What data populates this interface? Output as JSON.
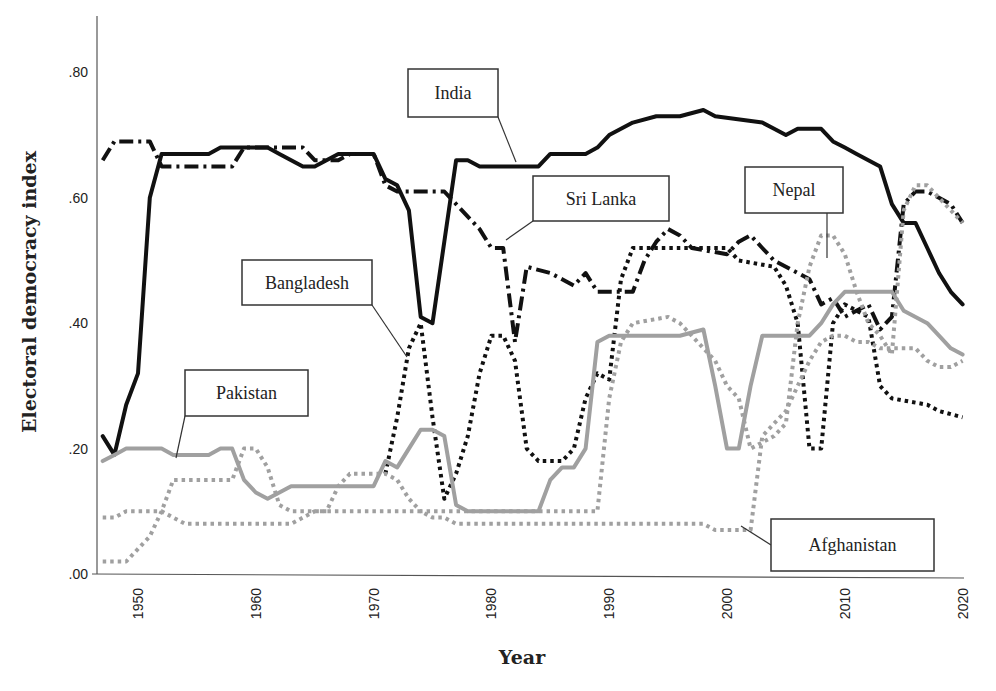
{
  "chart_data": {
    "type": "line",
    "title": "",
    "xlabel": "Year",
    "ylabel": "Electoral democracy index",
    "xlim": [
      1947,
      2020
    ],
    "ylim": [
      0,
      0.9
    ],
    "grid": false,
    "legend": "callout labels",
    "x_ticks": [
      "1950",
      "1960",
      "1970",
      "1980",
      "1990",
      "2000",
      "2010",
      "2020"
    ],
    "y_ticks": [
      ".00",
      ".20",
      ".40",
      ".60",
      ".80"
    ],
    "series": [
      {
        "name": "India",
        "style": "solid",
        "color": "#111111",
        "width": 4,
        "points": [
          [
            1947,
            0.22
          ],
          [
            1948,
            0.19
          ],
          [
            1949,
            0.27
          ],
          [
            1950,
            0.32
          ],
          [
            1951,
            0.6
          ],
          [
            1952,
            0.67
          ],
          [
            1956,
            0.67
          ],
          [
            1957,
            0.68
          ],
          [
            1961,
            0.68
          ],
          [
            1962,
            0.67
          ],
          [
            1964,
            0.65
          ],
          [
            1965,
            0.65
          ],
          [
            1967,
            0.67
          ],
          [
            1970,
            0.67
          ],
          [
            1971,
            0.63
          ],
          [
            1972,
            0.62
          ],
          [
            1973,
            0.58
          ],
          [
            1974,
            0.41
          ],
          [
            1975,
            0.4
          ],
          [
            1976,
            0.53
          ],
          [
            1977,
            0.66
          ],
          [
            1978,
            0.66
          ],
          [
            1979,
            0.65
          ],
          [
            1984,
            0.65
          ],
          [
            1985,
            0.67
          ],
          [
            1988,
            0.67
          ],
          [
            1989,
            0.68
          ],
          [
            1990,
            0.7
          ],
          [
            1992,
            0.72
          ],
          [
            1994,
            0.73
          ],
          [
            1996,
            0.73
          ],
          [
            1998,
            0.74
          ],
          [
            1999,
            0.73
          ],
          [
            2003,
            0.72
          ],
          [
            2004,
            0.71
          ],
          [
            2005,
            0.7
          ],
          [
            2006,
            0.71
          ],
          [
            2008,
            0.71
          ],
          [
            2009,
            0.69
          ],
          [
            2010,
            0.68
          ],
          [
            2011,
            0.67
          ],
          [
            2013,
            0.65
          ],
          [
            2014,
            0.59
          ],
          [
            2015,
            0.56
          ],
          [
            2016,
            0.56
          ],
          [
            2017,
            0.52
          ],
          [
            2018,
            0.48
          ],
          [
            2019,
            0.45
          ],
          [
            2020,
            0.43
          ]
        ]
      },
      {
        "name": "Sri Lanka",
        "style": "dashdot",
        "color": "#111111",
        "width": 4,
        "points": [
          [
            1947,
            0.66
          ],
          [
            1948,
            0.69
          ],
          [
            1951,
            0.69
          ],
          [
            1952,
            0.65
          ],
          [
            1958,
            0.65
          ],
          [
            1959,
            0.68
          ],
          [
            1964,
            0.68
          ],
          [
            1965,
            0.66
          ],
          [
            1967,
            0.66
          ],
          [
            1968,
            0.67
          ],
          [
            1970,
            0.67
          ],
          [
            1971,
            0.62
          ],
          [
            1972,
            0.61
          ],
          [
            1976,
            0.61
          ],
          [
            1977,
            0.59
          ],
          [
            1978,
            0.57
          ],
          [
            1979,
            0.55
          ],
          [
            1980,
            0.52
          ],
          [
            1981,
            0.52
          ],
          [
            1982,
            0.37
          ],
          [
            1983,
            0.49
          ],
          [
            1985,
            0.48
          ],
          [
            1986,
            0.47
          ],
          [
            1987,
            0.46
          ],
          [
            1988,
            0.48
          ],
          [
            1989,
            0.45
          ],
          [
            1992,
            0.45
          ],
          [
            1993,
            0.5
          ],
          [
            1994,
            0.53
          ],
          [
            1995,
            0.55
          ],
          [
            1996,
            0.54
          ],
          [
            1997,
            0.52
          ],
          [
            2000,
            0.51
          ],
          [
            2001,
            0.53
          ],
          [
            2002,
            0.54
          ],
          [
            2003,
            0.52
          ],
          [
            2004,
            0.5
          ],
          [
            2006,
            0.48
          ],
          [
            2007,
            0.47
          ],
          [
            2008,
            0.43
          ],
          [
            2009,
            0.44
          ],
          [
            2010,
            0.41
          ],
          [
            2012,
            0.43
          ],
          [
            2013,
            0.39
          ],
          [
            2014,
            0.41
          ],
          [
            2015,
            0.59
          ],
          [
            2016,
            0.61
          ],
          [
            2017,
            0.61
          ],
          [
            2018,
            0.6
          ],
          [
            2019,
            0.59
          ],
          [
            2020,
            0.56
          ]
        ]
      },
      {
        "name": "Bangladesh",
        "style": "dotted",
        "color": "#111111",
        "width": 4,
        "points": [
          [
            1971,
            0.16
          ],
          [
            1972,
            0.25
          ],
          [
            1973,
            0.36
          ],
          [
            1974,
            0.4
          ],
          [
            1975,
            0.25
          ],
          [
            1976,
            0.12
          ],
          [
            1977,
            0.16
          ],
          [
            1978,
            0.22
          ],
          [
            1979,
            0.32
          ],
          [
            1980,
            0.38
          ],
          [
            1981,
            0.38
          ],
          [
            1982,
            0.34
          ],
          [
            1983,
            0.2
          ],
          [
            1984,
            0.18
          ],
          [
            1986,
            0.18
          ],
          [
            1987,
            0.2
          ],
          [
            1988,
            0.28
          ],
          [
            1989,
            0.32
          ],
          [
            1990,
            0.31
          ],
          [
            1991,
            0.47
          ],
          [
            1992,
            0.52
          ],
          [
            2000,
            0.52
          ],
          [
            2001,
            0.5
          ],
          [
            2004,
            0.49
          ],
          [
            2005,
            0.46
          ],
          [
            2006,
            0.4
          ],
          [
            2007,
            0.2
          ],
          [
            2008,
            0.2
          ],
          [
            2009,
            0.4
          ],
          [
            2010,
            0.43
          ],
          [
            2011,
            0.42
          ],
          [
            2012,
            0.41
          ],
          [
            2013,
            0.3
          ],
          [
            2014,
            0.28
          ],
          [
            2017,
            0.27
          ],
          [
            2018,
            0.26
          ],
          [
            2020,
            0.25
          ]
        ]
      },
      {
        "name": "Pakistan",
        "style": "solid",
        "color": "#a0a0a0",
        "width": 4,
        "points": [
          [
            1947,
            0.18
          ],
          [
            1948,
            0.19
          ],
          [
            1949,
            0.2
          ],
          [
            1952,
            0.2
          ],
          [
            1953,
            0.19
          ],
          [
            1956,
            0.19
          ],
          [
            1957,
            0.2
          ],
          [
            1958,
            0.2
          ],
          [
            1959,
            0.15
          ],
          [
            1960,
            0.13
          ],
          [
            1961,
            0.12
          ],
          [
            1962,
            0.13
          ],
          [
            1963,
            0.14
          ],
          [
            1970,
            0.14
          ],
          [
            1971,
            0.18
          ],
          [
            1972,
            0.17
          ],
          [
            1973,
            0.2
          ],
          [
            1974,
            0.23
          ],
          [
            1975,
            0.23
          ],
          [
            1976,
            0.22
          ],
          [
            1977,
            0.11
          ],
          [
            1978,
            0.1
          ],
          [
            1984,
            0.1
          ],
          [
            1985,
            0.15
          ],
          [
            1986,
            0.17
          ],
          [
            1987,
            0.17
          ],
          [
            1988,
            0.2
          ],
          [
            1989,
            0.37
          ],
          [
            1990,
            0.38
          ],
          [
            1996,
            0.38
          ],
          [
            1998,
            0.39
          ],
          [
            1999,
            0.3
          ],
          [
            2000,
            0.2
          ],
          [
            2001,
            0.2
          ],
          [
            2002,
            0.3
          ],
          [
            2003,
            0.38
          ],
          [
            2007,
            0.38
          ],
          [
            2008,
            0.4
          ],
          [
            2009,
            0.43
          ],
          [
            2010,
            0.45
          ],
          [
            2014,
            0.45
          ],
          [
            2015,
            0.42
          ],
          [
            2016,
            0.41
          ],
          [
            2017,
            0.4
          ],
          [
            2018,
            0.38
          ],
          [
            2019,
            0.36
          ],
          [
            2020,
            0.35
          ]
        ]
      },
      {
        "name": "Nepal",
        "style": "dotted",
        "color": "#a0a0a0",
        "width": 4,
        "points": [
          [
            1947,
            0.02
          ],
          [
            1949,
            0.02
          ],
          [
            1950,
            0.04
          ],
          [
            1951,
            0.06
          ],
          [
            1952,
            0.1
          ],
          [
            1953,
            0.15
          ],
          [
            1958,
            0.15
          ],
          [
            1959,
            0.2
          ],
          [
            1960,
            0.2
          ],
          [
            1961,
            0.17
          ],
          [
            1962,
            0.11
          ],
          [
            1963,
            0.1
          ],
          [
            1966,
            0.1
          ],
          [
            1967,
            0.14
          ],
          [
            1968,
            0.16
          ],
          [
            1971,
            0.16
          ],
          [
            1972,
            0.15
          ],
          [
            1973,
            0.12
          ],
          [
            1974,
            0.1
          ],
          [
            1989,
            0.1
          ],
          [
            1990,
            0.28
          ],
          [
            1991,
            0.37
          ],
          [
            1992,
            0.4
          ],
          [
            1995,
            0.41
          ],
          [
            1996,
            0.4
          ],
          [
            1997,
            0.38
          ],
          [
            1998,
            0.36
          ],
          [
            1999,
            0.34
          ],
          [
            2000,
            0.3
          ],
          [
            2001,
            0.28
          ],
          [
            2002,
            0.2
          ],
          [
            2004,
            0.22
          ],
          [
            2005,
            0.24
          ],
          [
            2006,
            0.4
          ],
          [
            2007,
            0.49
          ],
          [
            2008,
            0.54
          ],
          [
            2009,
            0.54
          ],
          [
            2010,
            0.51
          ],
          [
            2011,
            0.45
          ],
          [
            2012,
            0.4
          ],
          [
            2013,
            0.38
          ],
          [
            2014,
            0.35
          ],
          [
            2015,
            0.58
          ],
          [
            2016,
            0.62
          ],
          [
            2017,
            0.62
          ],
          [
            2018,
            0.6
          ],
          [
            2019,
            0.58
          ],
          [
            2020,
            0.56
          ]
        ]
      },
      {
        "name": "Afghanistan",
        "style": "dotted",
        "color": "#a0a0a0",
        "width": 4,
        "points": [
          [
            1947,
            0.09
          ],
          [
            1948,
            0.09
          ],
          [
            1949,
            0.1
          ],
          [
            1952,
            0.1
          ],
          [
            1953,
            0.09
          ],
          [
            1954,
            0.08
          ],
          [
            1963,
            0.08
          ],
          [
            1964,
            0.09
          ],
          [
            1965,
            0.1
          ],
          [
            1974,
            0.1
          ],
          [
            1975,
            0.09
          ],
          [
            1976,
            0.09
          ],
          [
            1977,
            0.08
          ],
          [
            1998,
            0.08
          ],
          [
            1999,
            0.07
          ],
          [
            2002,
            0.07
          ],
          [
            2003,
            0.22
          ],
          [
            2004,
            0.24
          ],
          [
            2005,
            0.26
          ],
          [
            2006,
            0.3
          ],
          [
            2007,
            0.34
          ],
          [
            2008,
            0.37
          ],
          [
            2009,
            0.38
          ],
          [
            2010,
            0.38
          ],
          [
            2011,
            0.37
          ],
          [
            2012,
            0.37
          ],
          [
            2013,
            0.36
          ],
          [
            2016,
            0.36
          ],
          [
            2017,
            0.34
          ],
          [
            2018,
            0.33
          ],
          [
            2019,
            0.33
          ],
          [
            2020,
            0.34
          ]
        ]
      }
    ],
    "callouts": [
      {
        "label": "India",
        "box": [
          408,
          69,
          90,
          48
        ],
        "anchor": [
          516,
          162
        ]
      },
      {
        "label": "Sri Lanka",
        "box": [
          533,
          176,
          136,
          45
        ],
        "anchor": [
          506,
          240
        ]
      },
      {
        "label": "Nepal",
        "box": [
          745,
          167,
          98,
          46
        ],
        "anchor": [
          827,
          258
        ]
      },
      {
        "label": "Bangladesh",
        "box": [
          242,
          260,
          130,
          45
        ],
        "anchor": [
          407,
          357
        ]
      },
      {
        "label": "Pakistan",
        "box": [
          185,
          370,
          123,
          46
        ],
        "anchor": [
          176,
          458
        ]
      },
      {
        "label": "Afghanistan",
        "box": [
          771,
          519,
          163,
          52
        ],
        "anchor": [
          741,
          526
        ]
      }
    ]
  }
}
